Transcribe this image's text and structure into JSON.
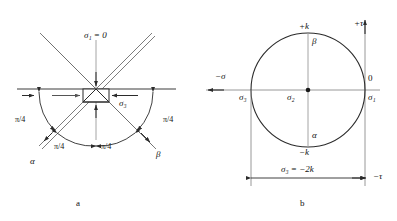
{
  "figure": {
    "panels": [
      {
        "id": "a",
        "tag": "a",
        "title_label": "slip-line field at free surface",
        "labels": {
          "sigma1_zero": "σ₁ = 0",
          "sigma3": "σ₃",
          "alpha": "α",
          "beta": "β",
          "angle_upper_left": "π/4",
          "angle_upper_right": "π/4",
          "angle_lower_left": "π/4",
          "angle_lower_right": "π/4"
        }
      },
      {
        "id": "b",
        "tag": "b",
        "title_label": "Mohr circle",
        "labels": {
          "plus_k": "+k",
          "minus_k": "−k",
          "beta": "β",
          "alpha": "α",
          "plus_tau": "+τ",
          "minus_tau": "−τ",
          "minus_sigma": "−σ",
          "sigma1": "σ₁",
          "sigma2": "σ₂",
          "sigma3": "σ₃",
          "zero": "0",
          "sigma3_value": "σ₃ = −2k"
        }
      }
    ],
    "colors": {
      "line": "#3d3d3d",
      "curve": "#2b2b2b",
      "axis": "#6b6b6b",
      "gray_line": "#8c8c8c",
      "background": "#ffffff",
      "text": "#111111"
    },
    "geometry": {
      "circle_center_x": 308,
      "circle_center_y": 90,
      "circle_radius": 57,
      "panel_a_origin_x": 96,
      "panel_a_origin_y": 89
    }
  }
}
